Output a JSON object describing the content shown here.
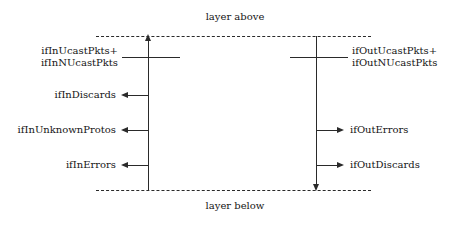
{
  "diagram": {
    "type": "interface-counter-flow-diagram",
    "boundaries": {
      "above_label": "layer above",
      "below_label": "layer below"
    },
    "ingress": {
      "stem_label": "inbound packet path",
      "packets_line1": "ifInUcastPkts+",
      "packets_line2": "ifInNUcastPkts",
      "discards": "ifInDiscards",
      "unknown_protos": "ifInUnknownProtos",
      "errors": "ifInErrors"
    },
    "egress": {
      "stem_label": "outbound packet path",
      "packets_line1": "ifOutUcastPkts+",
      "packets_line2": "ifOutNUcastPkts",
      "errors": "ifOutErrors",
      "discards": "ifOutDiscards"
    },
    "colors": {
      "ink": "#2a2a2a",
      "text": "#151515",
      "background": "#ffffff"
    }
  }
}
